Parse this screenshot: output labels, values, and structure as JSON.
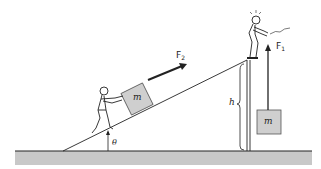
{
  "labels": {
    "mass_ramp": "m",
    "mass_hanging": "m",
    "force_ramp": "F",
    "force_ramp_sub": "2",
    "force_lift": "F",
    "force_lift_sub": "1",
    "height": "h",
    "angle": "θ"
  },
  "colors": {
    "line": "#222222",
    "block_fill": "#cfcfcf",
    "ground_fill": "#c8c8c8"
  }
}
